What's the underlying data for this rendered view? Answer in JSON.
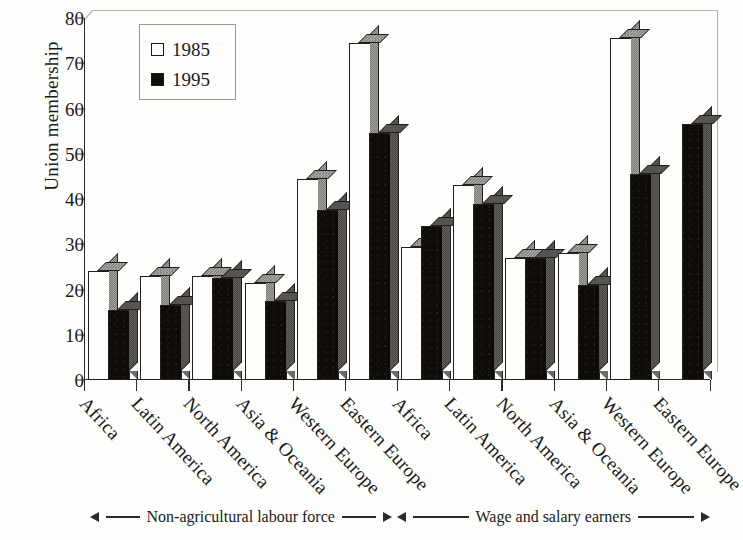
{
  "chart_data": {
    "type": "bar",
    "title": "",
    "xlabel": "",
    "ylabel": "Union membership",
    "ylim": [
      0,
      80
    ],
    "ytick_step": 10,
    "yticks": [
      0,
      10,
      20,
      30,
      40,
      50,
      60,
      70,
      80
    ],
    "grid": false,
    "legend_position": "top-left inside plot",
    "categories": [
      "Africa",
      "Latin America",
      "North America",
      "Asia & Oceania",
      "Western Europe",
      "Eastern Europe",
      "Africa",
      "Latin America",
      "North America",
      "Asia & Oceania",
      "Western Europe",
      "Eastern Europe"
    ],
    "series": [
      {
        "name": "1985",
        "color": "#fdfdfb",
        "values": [
          24,
          23,
          23,
          21.5,
          44.5,
          74.5,
          29.5,
          43,
          27,
          28,
          75.5,
          0
        ]
      },
      {
        "name": "1995",
        "color": "#0f0b08",
        "values": [
          15.5,
          16.5,
          22.5,
          17.5,
          37.5,
          54.5,
          34,
          39,
          27,
          21,
          45.5,
          56.5
        ]
      }
    ],
    "group_annotations": [
      {
        "label": "Non-agricultural labour force",
        "span_categories": [
          0,
          5
        ]
      },
      {
        "label": "Wage and salary earners",
        "span_categories": [
          6,
          11
        ]
      }
    ]
  },
  "legend": {
    "entries": [
      {
        "label": "1985",
        "swatch": "hollow-square"
      },
      {
        "label": "1995",
        "swatch": "filled-square"
      }
    ]
  },
  "axis": {
    "y_title": "Union membership",
    "y_tick_labels": [
      "80",
      "70",
      "60",
      "50",
      "40",
      "30",
      "20",
      "10",
      "0"
    ]
  },
  "annotations": {
    "left_bracket": "Non-agricultural labour force",
    "right_bracket": "Wage and salary earners"
  }
}
